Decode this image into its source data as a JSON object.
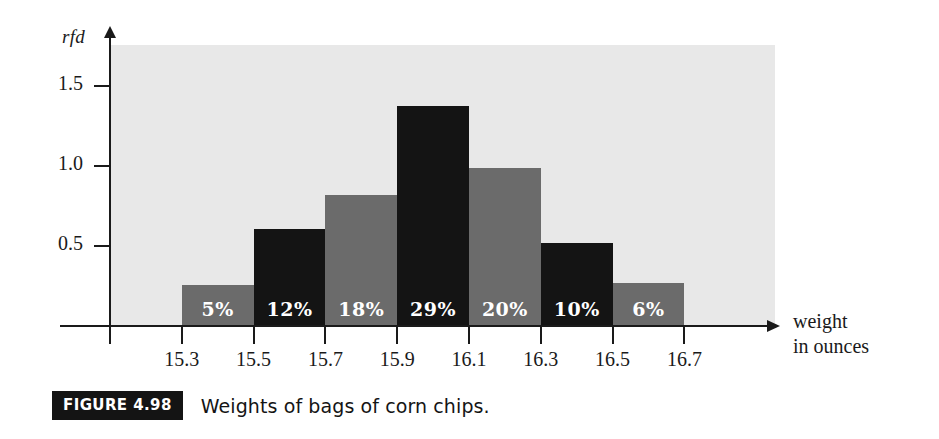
{
  "figure": {
    "badge": "FIGURE 4.98",
    "caption": "Weights of bags of corn chips."
  },
  "colors": {
    "plot_background": "#e8e8e8",
    "axis": "#1a1a1a",
    "bar_gray": "#6b6b6b",
    "bar_black": "#141414",
    "bar_label_text": "#ffffff",
    "badge_background": "#141414"
  },
  "chart_data": {
    "type": "bar",
    "title": "",
    "subtitle": "",
    "xlabel": "weight in ounces",
    "xlabel_lines": [
      "weight",
      "in ounces"
    ],
    "ylabel": "rfd",
    "ylim": [
      0,
      1.7
    ],
    "xlim": [
      15.1,
      16.9
    ],
    "grid": false,
    "legend": null,
    "y_ticks": [
      {
        "value": 0.5,
        "label": "0.5"
      },
      {
        "value": 1.0,
        "label": "1.0"
      },
      {
        "value": 1.5,
        "label": "1.5"
      }
    ],
    "x_ticks": [
      {
        "value": 15.1,
        "label": ""
      },
      {
        "value": 15.3,
        "label": "15.3"
      },
      {
        "value": 15.5,
        "label": "15.5"
      },
      {
        "value": 15.7,
        "label": "15.7"
      },
      {
        "value": 15.9,
        "label": "15.9"
      },
      {
        "value": 16.1,
        "label": "16.1"
      },
      {
        "value": 16.3,
        "label": "16.3"
      },
      {
        "value": 16.5,
        "label": "16.5"
      },
      {
        "value": 16.7,
        "label": "16.7"
      }
    ],
    "class_width": 0.2,
    "categories": [
      "15.3-15.5",
      "15.5-15.7",
      "15.7-15.9",
      "15.9-16.1",
      "16.1-16.3",
      "16.3-16.5",
      "16.5-16.7"
    ],
    "bars": [
      {
        "x_start": 15.3,
        "x_end": 15.5,
        "value": 0.25,
        "label": "5%",
        "percent": 5,
        "fill": "gray"
      },
      {
        "x_start": 15.5,
        "x_end": 15.7,
        "value": 0.6,
        "label": "12%",
        "percent": 12,
        "fill": "black"
      },
      {
        "x_start": 15.7,
        "x_end": 15.9,
        "value": 0.81,
        "label": "18%",
        "percent": 18,
        "fill": "gray"
      },
      {
        "x_start": 15.9,
        "x_end": 16.1,
        "value": 1.37,
        "label": "29%",
        "percent": 29,
        "fill": "black"
      },
      {
        "x_start": 16.1,
        "x_end": 16.3,
        "value": 0.98,
        "label": "20%",
        "percent": 20,
        "fill": "gray"
      },
      {
        "x_start": 16.3,
        "x_end": 16.5,
        "value": 0.51,
        "label": "10%",
        "percent": 10,
        "fill": "black"
      },
      {
        "x_start": 16.5,
        "x_end": 16.7,
        "value": 0.26,
        "label": "6%",
        "percent": 6,
        "fill": "gray"
      }
    ],
    "values": [
      0.25,
      0.6,
      0.81,
      1.37,
      0.98,
      0.51,
      0.26
    ],
    "percent_labels": [
      "5%",
      "12%",
      "18%",
      "29%",
      "20%",
      "10%",
      "6%"
    ]
  }
}
